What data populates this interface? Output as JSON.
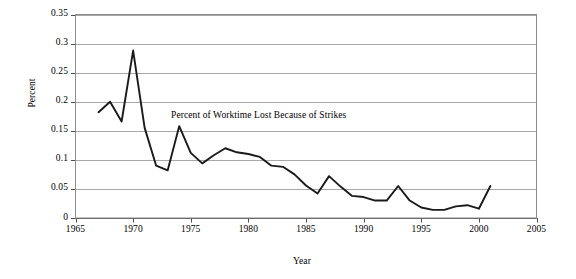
{
  "chart_data": {
    "type": "line",
    "title": "",
    "annotation": "Percent of Worktime Lost Because of Strikes",
    "xlabel": "Year",
    "ylabel": "Percent",
    "xlim": [
      1965,
      2005
    ],
    "ylim": [
      0,
      0.35
    ],
    "grid": "horizontal",
    "legend": "none",
    "xticks": [
      1965,
      1970,
      1975,
      1980,
      1985,
      1990,
      1995,
      2000,
      2005
    ],
    "xtick_labels": [
      "1965",
      "1970",
      "1975",
      "1980",
      "1985",
      "1990",
      "1995",
      "2000",
      "2005"
    ],
    "yticks": [
      0,
      0.05,
      0.1,
      0.15,
      0.2,
      0.25,
      0.3,
      0.35
    ],
    "ytick_labels": [
      "0",
      "0.05",
      "0.1",
      "0.15",
      "0.2",
      "0.25",
      "0.3",
      "0.35"
    ],
    "series_color": "#1a1a1a",
    "x": [
      1967,
      1968,
      1969,
      1970,
      1971,
      1972,
      1973,
      1974,
      1975,
      1976,
      1977,
      1978,
      1979,
      1980,
      1981,
      1982,
      1983,
      1984,
      1985,
      1986,
      1987,
      1988,
      1989,
      1990,
      1991,
      1992,
      1993,
      1994,
      1995,
      1996,
      1997,
      1998,
      1999,
      2000,
      2001
    ],
    "values": [
      0.182,
      0.2,
      0.166,
      0.288,
      0.155,
      0.09,
      0.082,
      0.158,
      0.112,
      0.094,
      0.108,
      0.12,
      0.113,
      0.11,
      0.105,
      0.09,
      0.088,
      0.075,
      0.056,
      0.042,
      0.072,
      0.054,
      0.038,
      0.036,
      0.03,
      0.03,
      0.055,
      0.03,
      0.018,
      0.014,
      0.014,
      0.02,
      0.022,
      0.016,
      0.055
    ]
  }
}
